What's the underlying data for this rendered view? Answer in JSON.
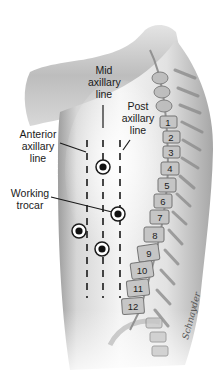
{
  "figure": {
    "labels": {
      "mid_axillary": "Mid\naxillary\nline",
      "post_axillary": "Post\naxillary\nline",
      "anterior_axillary": "Anterior\naxillary\nline",
      "working_trocar": "Working\ntrocar"
    },
    "vertebrae": [
      {
        "label": "1",
        "x": 168,
        "y": 122
      },
      {
        "label": "2",
        "x": 171,
        "y": 137
      },
      {
        "label": "3",
        "x": 171,
        "y": 152
      },
      {
        "label": "4",
        "x": 170,
        "y": 168
      },
      {
        "label": "5",
        "x": 167,
        "y": 185
      },
      {
        "label": "6",
        "x": 163,
        "y": 201
      },
      {
        "label": "7",
        "x": 160,
        "y": 217
      },
      {
        "label": "8",
        "x": 155,
        "y": 235
      },
      {
        "label": "9",
        "x": 149,
        "y": 253
      },
      {
        "label": "10",
        "x": 142,
        "y": 270
      },
      {
        "label": "11",
        "x": 138,
        "y": 288
      },
      {
        "label": "12",
        "x": 133,
        "y": 306
      }
    ],
    "trocar_ports": [
      {
        "name": "mid-upper",
        "x": 103,
        "y": 167
      },
      {
        "name": "working",
        "x": 118,
        "y": 214
      },
      {
        "name": "anterior",
        "x": 79,
        "y": 231
      },
      {
        "name": "mid-lower",
        "x": 102,
        "y": 249
      }
    ],
    "signature": "Schnayder",
    "colors": {
      "body_fill": "#c8c8c8",
      "body_shadow": "#9a9a9a",
      "line": "#1a1a1a",
      "vertebra": "#b5b5b5"
    }
  }
}
